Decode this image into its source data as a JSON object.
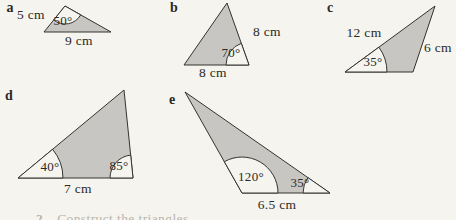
{
  "page": {
    "background_color": "#f5f4ef",
    "triangle_fill_color": "#c7c6c3",
    "outline_color": "#35332e",
    "footer_fragment": {
      "number": "2",
      "text": "Construct the triangles"
    }
  },
  "triangles": {
    "a": {
      "label": "a",
      "angle": "50°",
      "side_left": "5 cm",
      "side_base": "9 cm"
    },
    "b": {
      "label": "b",
      "angle": "70°",
      "side_right": "8 cm",
      "side_base": "8 cm"
    },
    "c": {
      "label": "c",
      "angle": "35°",
      "side_top": "12 cm",
      "side_right": "6 cm"
    },
    "d": {
      "label": "d",
      "angle_left": "40°",
      "angle_right": "85°",
      "side_base": "7 cm"
    },
    "e": {
      "label": "e",
      "angle_left": "120°",
      "angle_right": "35°",
      "side_base": "6.5 cm"
    }
  }
}
